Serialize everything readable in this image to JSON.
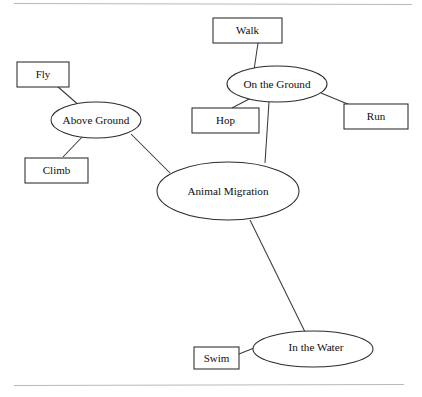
{
  "page": {
    "background_color": "#ffffff",
    "rule_color": "#b9b9b9",
    "node_stroke_color": "#2b2b2b",
    "edge_color": "#3a3a3a",
    "text_color": "#0d0d0d",
    "width": 422,
    "height": 397
  },
  "diagram": {
    "type": "concept-map",
    "root_label": "Animal Migration",
    "nodes": {
      "center": {
        "label": "Animal Migration",
        "shape": "ellipse",
        "cx": 228,
        "cy": 191,
        "rx": 71,
        "ry": 29
      },
      "above_ground": {
        "label": "Above Ground",
        "shape": "ellipse",
        "cx": 96,
        "cy": 120,
        "rx": 45,
        "ry": 18
      },
      "on_the_ground": {
        "label": "On the Ground",
        "shape": "ellipse",
        "cx": 277,
        "cy": 84,
        "rx": 50,
        "ry": 18
      },
      "in_the_water": {
        "label": "In the Water",
        "shape": "ellipse",
        "cx": 313,
        "cy": 349,
        "rx": 60,
        "ry": 18
      },
      "fly": {
        "label": "Fly",
        "shape": "rect",
        "x": 17,
        "y": 62,
        "width": 52,
        "height": 25
      },
      "climb": {
        "label": "Climb",
        "shape": "rect",
        "x": 25,
        "y": 158,
        "width": 63,
        "height": 25
      },
      "walk": {
        "label": "Walk",
        "shape": "rect",
        "x": 213,
        "y": 18,
        "width": 69,
        "height": 25
      },
      "hop": {
        "label": "Hop",
        "shape": "rect",
        "x": 192,
        "y": 108,
        "width": 67,
        "height": 25
      },
      "run": {
        "label": "Run",
        "shape": "rect",
        "x": 344,
        "y": 104,
        "width": 64,
        "height": 25
      },
      "swim": {
        "label": "Swim",
        "shape": "rect",
        "x": 194,
        "y": 347,
        "width": 45,
        "height": 22
      }
    },
    "edges": [
      {
        "from": "center",
        "to": "above_ground",
        "x1": 170,
        "y1": 173,
        "x2": 131,
        "y2": 134
      },
      {
        "from": "center",
        "to": "on_the_ground",
        "x1": 265,
        "y1": 163,
        "x2": 269,
        "y2": 102
      },
      {
        "from": "center",
        "to": "in_the_water",
        "x1": 250,
        "y1": 220,
        "x2": 307,
        "y2": 336
      },
      {
        "from": "above_ground",
        "to": "fly",
        "x1": 81,
        "y1": 107,
        "x2": 57,
        "y2": 86
      },
      {
        "from": "above_ground",
        "to": "climb",
        "x1": 84,
        "y1": 135,
        "x2": 63,
        "y2": 157
      },
      {
        "from": "on_the_ground",
        "to": "walk",
        "x1": 254,
        "y1": 70,
        "x2": 258,
        "y2": 43
      },
      {
        "from": "on_the_ground",
        "to": "hop",
        "x1": 251,
        "y1": 98,
        "x2": 232,
        "y2": 108
      },
      {
        "from": "on_the_ground",
        "to": "run",
        "x1": 321,
        "y1": 93,
        "x2": 350,
        "y2": 105
      },
      {
        "from": "in_the_water",
        "to": "swim",
        "x1": 254,
        "y1": 348,
        "x2": 239,
        "y2": 354
      }
    ],
    "rules": [
      {
        "name": "top-rule",
        "x1": 14,
        "y1": 3.5,
        "x2": 412,
        "y2": 4.5
      },
      {
        "name": "bottom-rule",
        "x1": 14,
        "y1": 385.5,
        "x2": 404,
        "y2": 384.5
      }
    ]
  }
}
